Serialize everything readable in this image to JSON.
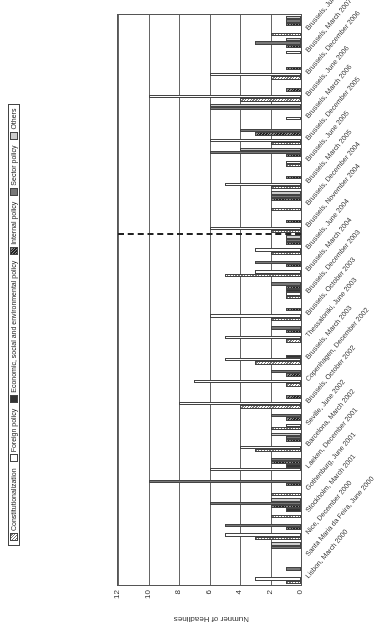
{
  "chart_data": {
    "type": "bar",
    "orientation": "rotated-90",
    "title": "",
    "xlabel": "",
    "ylabel": "Numner of Headlines",
    "ylim": [
      0,
      12
    ],
    "yticks": [
      0,
      2,
      4,
      6,
      8,
      10,
      12
    ],
    "grid": true,
    "legend_position": "bottom",
    "categories": [
      "Lisbon, March 2000",
      "Santa Maria da Feira, June 2000",
      "Nice, December 2000",
      "Stockholm, March 2001",
      "Gothenburg, June 2001",
      "Laeken, December 2001",
      "Barcelona, March 2002",
      "Seville, June 2002",
      "Brussels, October 2002",
      "Copenhagen, December 2002",
      "Brussels, March 2003",
      "Thessaloniki, June 2003",
      "Brussels, October 2003",
      "Brussels, December 2003",
      "Brussels, March 2004",
      "Brussels, June 2004",
      "Brussels, November 2004",
      "Brussels, December 2004",
      "Brussels, March 2005",
      "Brussels, June 2005",
      "Brussels, December 2005",
      "Brussels, March 2006",
      "Brussels, June 2006",
      "Brussels, December 2006",
      "Brussels, March 2007",
      "Brussels, June 2007"
    ],
    "series": [
      {
        "name": "Constitutionalization",
        "values": [
          1,
          0,
          3,
          2,
          2,
          0,
          3,
          2,
          4,
          1,
          3,
          1,
          2,
          1,
          5,
          2,
          2,
          2,
          2,
          1,
          2,
          0,
          4,
          2,
          0,
          2
        ]
      },
      {
        "name": "Foreign policy",
        "values": [
          3,
          0,
          5,
          0,
          0,
          6,
          4,
          1,
          8,
          7,
          5,
          5,
          6,
          1,
          3,
          3,
          6,
          0,
          5,
          1,
          6,
          1,
          10,
          6,
          1,
          0
        ]
      },
      {
        "name": "Economic, social and environmental policy",
        "values": [
          0,
          0,
          0,
          1,
          0,
          1,
          0,
          0,
          0,
          0,
          1,
          0,
          0,
          1,
          0,
          0,
          0,
          0,
          0,
          0,
          0,
          0,
          0,
          0,
          0,
          0
        ]
      },
      {
        "name": "Internal policy",
        "values": [
          0,
          0,
          1,
          2,
          1,
          2,
          1,
          1,
          1,
          1,
          0,
          1,
          1,
          1,
          1,
          1,
          1,
          2,
          1,
          1,
          3,
          0,
          1,
          1,
          1,
          1
        ]
      },
      {
        "name": "Sector policy",
        "values": [
          1,
          2,
          5,
          6,
          10,
          2,
          1,
          2,
          0,
          2,
          0,
          2,
          0,
          2,
          3,
          1,
          0,
          2,
          0,
          6,
          4,
          6,
          0,
          0,
          3,
          1
        ]
      },
      {
        "name": "Others",
        "values": [
          0,
          2,
          0,
          2,
          0,
          0,
          2,
          0,
          0,
          0,
          0,
          0,
          0,
          0,
          0,
          1,
          0,
          2,
          0,
          4,
          0,
          6,
          0,
          0,
          1,
          1
        ]
      }
    ],
    "annotations": [
      {
        "type": "dashed-vertical-line",
        "between": [
          "Brussels, June 2004",
          "Brussels, November 2004"
        ]
      }
    ]
  },
  "axis": {
    "ylabel": "Numner of Headlines",
    "ticks": [
      "0",
      "2",
      "4",
      "6",
      "8",
      "10",
      "12"
    ]
  },
  "legend": {
    "items": [
      {
        "label": "Constitutionalization",
        "swatch": "s0"
      },
      {
        "label": "Foreign policy",
        "swatch": "s1"
      },
      {
        "label": "Economic, social and environmental policy",
        "swatch": "s2"
      },
      {
        "label": "Internal policy",
        "swatch": "s3"
      },
      {
        "label": "Sector policy",
        "swatch": "s4"
      },
      {
        "label": "Others",
        "swatch": "s5"
      }
    ]
  }
}
